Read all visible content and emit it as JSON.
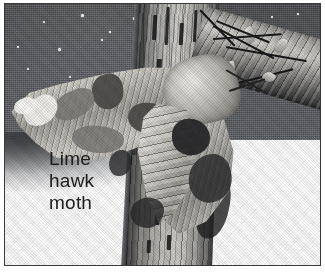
{
  "figure": {
    "kind": "natural-history-illustration",
    "caption": {
      "line1": "Lime",
      "line2": "hawk",
      "line3": "moth",
      "full_text": "Lime hawk moth",
      "text_color": "#212122",
      "background": "#ffffff"
    },
    "frame": {
      "border_color": "#3a3a3a",
      "page_background": "#ffffff"
    },
    "palette": {
      "sky_dark": "#585a5c",
      "sky_light": "#6d7073",
      "trunk_light": "#cfcdc8",
      "trunk_dark": "#2d2d2e",
      "moth_wing_light": "#e7e5e0",
      "moth_wing_mid": "#9d9b95",
      "moth_marking_dark": "#4b4a48",
      "ground_white": "#ffffff",
      "ink_black": "#17171a"
    },
    "scene_elements": [
      {
        "name": "night-sky",
        "description": "dark grey halftone sky with small white star specks"
      },
      {
        "name": "tree-trunk",
        "description": "vertical bark-textured trunk running top to bottom, slightly right of centre"
      },
      {
        "name": "diagonal-branch",
        "description": "branch with twigs and buds crossing the upper right"
      },
      {
        "name": "lime-hawk-moth",
        "description": "moth with scalloped forewings, mottled grey-green markings, clinging to the trunk"
      },
      {
        "name": "ground-glow",
        "description": "pale white ground / mist at the lower left"
      }
    ],
    "stars": [
      {
        "x": 12,
        "y": 42,
        "size": 2
      },
      {
        "x": 38,
        "y": 17,
        "size": 2
      },
      {
        "x": 53,
        "y": 44,
        "size": 3
      },
      {
        "x": 76,
        "y": 10,
        "size": 3
      },
      {
        "x": 96,
        "y": 35,
        "size": 2
      },
      {
        "x": 104,
        "y": 27,
        "size": 2
      },
      {
        "x": 128,
        "y": 13,
        "size": 3
      },
      {
        "x": 132,
        "y": 52,
        "size": 2
      },
      {
        "x": 150,
        "y": 24,
        "size": 2
      },
      {
        "x": 270,
        "y": 12,
        "size": 2
      },
      {
        "x": 296,
        "y": 9,
        "size": 2
      },
      {
        "x": 22,
        "y": 64,
        "size": 2
      },
      {
        "x": 64,
        "y": 72,
        "size": 2
      }
    ]
  }
}
